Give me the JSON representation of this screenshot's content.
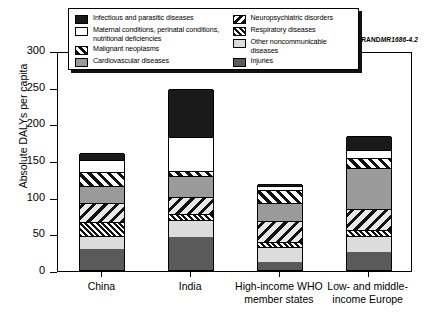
{
  "figure_id_prefix": "RAND",
  "figure_id_suffix": "MR1686-4.2",
  "axis": {
    "ylabel": "Absolute DALYs per capita",
    "yticks": [
      "0",
      "50",
      "100",
      "150",
      "200",
      "250",
      "300"
    ]
  },
  "legend": {
    "left": [
      {
        "key": "infectious",
        "label": "Infectious and parasitic diseases"
      },
      {
        "key": "maternal",
        "label": "Maternal conditions, perinatal conditions, nutritional deficiencies"
      },
      {
        "key": "malignant",
        "label": "Malignant neoplasms"
      },
      {
        "key": "cardio",
        "label": "Cardiovascular diseases"
      }
    ],
    "right": [
      {
        "key": "neuro",
        "label": "Neuropsychiatric disorders"
      },
      {
        "key": "resp",
        "label": "Respiratory diseases"
      },
      {
        "key": "other",
        "label": "Other noncommunicable diseases"
      },
      {
        "key": "injuries",
        "label": "Injuries"
      }
    ]
  },
  "chart_data": {
    "type": "bar",
    "title": "",
    "subtitle": "",
    "xlabel": "",
    "ylabel": "Absolute DALYs per capita",
    "ylim": [
      0,
      300
    ],
    "ytick_step": 50,
    "grid": false,
    "stacked": true,
    "legend_position": "top",
    "categories": [
      "China",
      "India",
      "High-income WHO member states",
      "Low- and middle-income Europe"
    ],
    "series": [
      {
        "name": "Injuries",
        "key": "injuries",
        "values": [
          29,
          45,
          11,
          25
        ]
      },
      {
        "name": "Other noncommunicable diseases",
        "key": "other",
        "values": [
          18,
          23,
          20,
          22
        ]
      },
      {
        "name": "Respiratory diseases",
        "key": "resp",
        "values": [
          19,
          8,
          7,
          8
        ]
      },
      {
        "name": "Neuropsychiatric disorders",
        "key": "neuro",
        "values": [
          26,
          23,
          29,
          28
        ]
      },
      {
        "name": "Cardiovascular diseases",
        "key": "cardio",
        "values": [
          22,
          29,
          24,
          56
        ]
      },
      {
        "name": "Malignant neoplasms",
        "key": "malignant",
        "values": [
          20,
          7,
          18,
          14
        ]
      },
      {
        "name": "Maternal conditions, perinatal conditions, nutritional deficiencies",
        "key": "maternal",
        "values": [
          16,
          46,
          5,
          10
        ]
      },
      {
        "name": "Infectious and parasitic diseases",
        "key": "infectious",
        "values": [
          10,
          66,
          3,
          20
        ]
      }
    ],
    "totals": [
      160,
      247,
      117,
      183
    ]
  }
}
